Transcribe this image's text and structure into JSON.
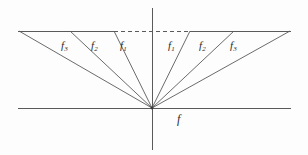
{
  "figure": {
    "background_color": "#fdfdfd",
    "line_color": "#5a5a5a",
    "text_color": "#2b2b2b",
    "axes": {
      "horizontal": {
        "name": "horizontal-axis",
        "x1": 18,
        "y1": 108,
        "x2": 291,
        "y2": 108
      },
      "vertical": {
        "name": "vertical-axis",
        "x1": 152,
        "y1": 8,
        "x2": 152,
        "y2": 150
      },
      "origin": {
        "x": 152,
        "y": 108
      }
    },
    "top_line": {
      "y": 31,
      "x_left": 18,
      "x_right": 291,
      "solid_left_end": 114,
      "solid_right_start": 190,
      "dash_pattern": "4 3"
    },
    "rays": [
      {
        "id": "left-f3",
        "label": "f",
        "sub": "3",
        "x_top": 19,
        "y_top": 31,
        "label_x": 61,
        "label_y": 40
      },
      {
        "id": "left-f2",
        "label": "f",
        "sub": "2",
        "x_top": 70,
        "y_top": 31,
        "label_x": 91,
        "label_y": 40
      },
      {
        "id": "left-f1",
        "label": "f",
        "sub": "1",
        "x_top": 114,
        "y_top": 31,
        "label_x": 120,
        "label_y": 40
      },
      {
        "id": "right-f1",
        "label": "f",
        "sub": "1",
        "x_top": 190,
        "y_top": 31,
        "label_x": 168,
        "label_y": 40
      },
      {
        "id": "right-f2",
        "label": "f",
        "sub": "2",
        "x_top": 234,
        "y_top": 31,
        "label_x": 199,
        "label_y": 40
      },
      {
        "id": "right-f3",
        "label": "f",
        "sub": "3",
        "x_top": 290,
        "y_top": 31,
        "label_x": 230,
        "label_y": 40
      }
    ],
    "axis_label": {
      "name": "f-axis-label",
      "text": "f",
      "x": 177,
      "y": 113
    }
  }
}
